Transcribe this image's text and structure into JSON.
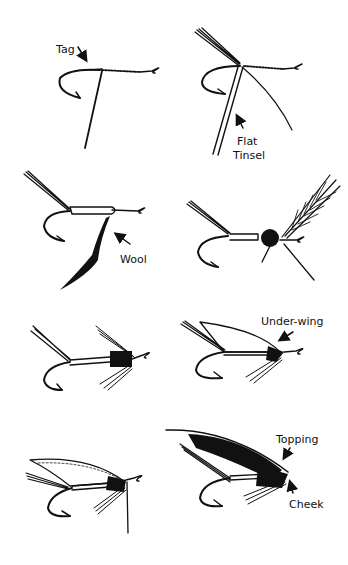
{
  "diagram": {
    "title": "",
    "panels": [
      {
        "id": 1,
        "stage": "tag",
        "labels": [
          "Tag"
        ]
      },
      {
        "id": 2,
        "stage": "tail-and-tinsel",
        "labels": [
          "Flat",
          "Tinsel"
        ]
      },
      {
        "id": 3,
        "stage": "wool-body",
        "labels": [
          "Wool"
        ]
      },
      {
        "id": 4,
        "stage": "hackle",
        "labels": []
      },
      {
        "id": 5,
        "stage": "throat-hackle",
        "labels": []
      },
      {
        "id": 6,
        "stage": "under-wing",
        "labels": [
          "Under-wing"
        ]
      },
      {
        "id": 7,
        "stage": "main-wing",
        "labels": []
      },
      {
        "id": 8,
        "stage": "topping-and-cheek",
        "labels": [
          "Topping",
          "Cheek"
        ]
      }
    ]
  },
  "labels": {
    "tag": "Tag",
    "flat": "Flat",
    "tinsel": "Tinsel",
    "wool": "Wool",
    "under_wing": "Under-wing",
    "topping": "Topping",
    "cheek": "Cheek"
  },
  "colors": {
    "ink": "#111111",
    "paper": "#ffffff"
  }
}
